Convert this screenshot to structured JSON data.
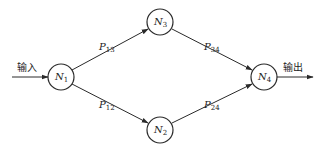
{
  "diagram": {
    "type": "network-flow",
    "input_label": "输入",
    "output_label": "输出",
    "nodes": [
      {
        "id": "N1",
        "base": "N",
        "sub": "1",
        "x": 61,
        "y": 77
      },
      {
        "id": "N2",
        "base": "N",
        "sub": "2",
        "x": 160,
        "y": 130
      },
      {
        "id": "N3",
        "base": "N",
        "sub": "3",
        "x": 160,
        "y": 22
      },
      {
        "id": "N4",
        "base": "N",
        "sub": "4",
        "x": 264,
        "y": 77
      }
    ],
    "edges": [
      {
        "from": "N1",
        "to": "N3",
        "base": "P",
        "sub": "13"
      },
      {
        "from": "N1",
        "to": "N2",
        "base": "P",
        "sub": "12"
      },
      {
        "from": "N3",
        "to": "N4",
        "base": "P",
        "sub": "34"
      },
      {
        "from": "N2",
        "to": "N4",
        "base": "P",
        "sub": "24"
      }
    ],
    "colors": {
      "stroke": "#2a2a2a",
      "background": "#ffffff",
      "text": "#222222"
    }
  }
}
